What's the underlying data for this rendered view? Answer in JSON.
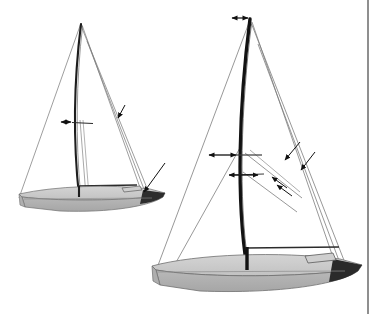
{
  "figure": {
    "type": "technical-line-illustration",
    "background_color": "#ffffff",
    "page_edge_color": "#8f8f8f",
    "page_edge_x": 367,
    "width": 380,
    "height": 314,
    "visible_text": []
  },
  "palette": {
    "mast": "#1a1a1a",
    "rigging_line": "#7a7a7a",
    "spar": "#2b2b2b",
    "hull_deck": "#c9c9c9",
    "hull_topside": "#b5b5b5",
    "hull_side_shadow": "#a8a8a8",
    "hull_outline": "#6e6e6e",
    "transom_dark": "#2a2a2a",
    "arrow": "#111111"
  },
  "boats": [
    {
      "id": "boat-small-left",
      "label": "small-sailboat-left",
      "mast": {
        "head_x": 81,
        "head_y": 24,
        "heel_x": 79,
        "heel_y": 196,
        "bend_control_x": 72,
        "bend_control_y": 115,
        "stroke_width": 2.1
      },
      "hull": {
        "bow_x": 165,
        "stern_x": 18,
        "sheer_y": 193,
        "keel_y": 212
      },
      "spreader": {
        "x1": 66,
        "y1": 122,
        "x2": 92,
        "y2": 123
      },
      "boom": {
        "x1": 78,
        "y1": 186,
        "x2": 135,
        "y2": 185
      },
      "arrows": [
        {
          "name": "spreader-deflection-arrow",
          "x1": 70,
          "y1": 122,
          "x2": 60,
          "y2": 122,
          "heads": "both"
        },
        {
          "name": "shroud-tension-arrow",
          "x1": 122,
          "y1": 111,
          "x2": 116,
          "y2": 121,
          "heads": "end"
        }
      ],
      "rigging": [
        {
          "name": "forestay",
          "x1": 81,
          "y1": 24,
          "x2": 152,
          "y2": 196
        },
        {
          "name": "backstay",
          "x1": 81,
          "y1": 24,
          "x2": 20,
          "y2": 196
        },
        {
          "name": "shroud-upper",
          "x1": 81,
          "y1": 24,
          "x2": 140,
          "y2": 190
        },
        {
          "name": "shroud-lower",
          "x1": 86,
          "y1": 40,
          "x2": 143,
          "y2": 192
        },
        {
          "name": "jib-luff",
          "x1": 81,
          "y1": 132,
          "x2": 87,
          "y2": 196
        }
      ]
    },
    {
      "id": "boat-large-right",
      "label": "large-sailboat-right",
      "mast": {
        "head_x": 250,
        "head_y": 19,
        "heel_x": 247,
        "heel_y": 268,
        "bend_control_x": 236,
        "bend_control_y": 150,
        "stroke_width": 3.3
      },
      "hull": {
        "bow_x": 360,
        "stern_x": 150,
        "sheer_y": 265,
        "keel_y": 292
      },
      "spreaders": [
        {
          "x1": 235,
          "y1": 155,
          "x2": 260,
          "y2": 155
        },
        {
          "x1": 231,
          "y1": 175,
          "x2": 263,
          "y2": 174
        }
      ],
      "boom": {
        "x1": 246,
        "y1": 248,
        "x2": 337,
        "y2": 247
      },
      "arrows": [
        {
          "name": "masthead-rake-arrow",
          "x1": 248,
          "y1": 18,
          "x2": 232,
          "y2": 18,
          "heads": "both"
        },
        {
          "name": "upper-spreader-deflection-arrow",
          "x1": 236,
          "y1": 155,
          "x2": 209,
          "y2": 155,
          "heads": "both"
        },
        {
          "name": "lower-spreader-deflection-arrow",
          "x1": 229,
          "y1": 175,
          "x2": 258,
          "y2": 175,
          "heads": "both"
        },
        {
          "name": "shroud-load-arrow-left",
          "x1": 165,
          "y1": 163,
          "x2": 144,
          "y2": 192,
          "heads": "end"
        },
        {
          "name": "shroud-load-arrow-right-upper",
          "x1": 300,
          "y1": 142,
          "x2": 285,
          "y2": 160,
          "heads": "end"
        },
        {
          "name": "shroud-load-arrow-right-lower",
          "x1": 315,
          "y1": 152,
          "x2": 301,
          "y2": 170,
          "heads": "end"
        },
        {
          "name": "diagonal-load-arrow-a",
          "x1": 287,
          "y1": 188,
          "x2": 272,
          "y2": 177,
          "heads": "end"
        },
        {
          "name": "diagonal-load-arrow-b",
          "x1": 292,
          "y1": 196,
          "x2": 277,
          "y2": 185,
          "heads": "end"
        }
      ],
      "rigging": [
        {
          "name": "forestay",
          "x1": 250,
          "y1": 19,
          "x2": 345,
          "y2": 265
        },
        {
          "name": "backstay",
          "x1": 250,
          "y1": 19,
          "x2": 158,
          "y2": 266
        },
        {
          "name": "shroud-starboard-upper",
          "x1": 250,
          "y1": 19,
          "x2": 333,
          "y2": 262
        },
        {
          "name": "shroud-starboard-lower",
          "x1": 258,
          "y1": 45,
          "x2": 337,
          "y2": 263
        },
        {
          "name": "lower-shroud-port",
          "x1": 240,
          "y1": 148,
          "x2": 173,
          "y2": 264
        },
        {
          "name": "diagonal-port",
          "x1": 243,
          "y1": 172,
          "x2": 296,
          "y2": 210
        },
        {
          "name": "diagonal-starboard",
          "x1": 245,
          "y1": 155,
          "x2": 300,
          "y2": 200
        }
      ]
    }
  ]
}
